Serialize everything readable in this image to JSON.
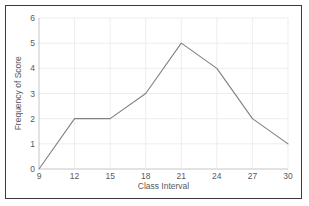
{
  "chart_data": {
    "type": "line",
    "title": "",
    "xlabel": "Class Interval",
    "ylabel": "Frequency of Score",
    "x": [
      9,
      12,
      15,
      18,
      21,
      24,
      27,
      30
    ],
    "values": [
      0,
      2,
      2,
      3,
      5,
      4,
      2,
      1
    ],
    "series": [
      {
        "name": "Frequency of Score",
        "values": [
          0,
          2,
          2,
          3,
          5,
          4,
          2,
          1
        ]
      }
    ],
    "xticks": [
      "9",
      "12",
      "15",
      "18",
      "21",
      "24",
      "27",
      "30"
    ],
    "yticks": [
      "0",
      "1",
      "2",
      "3",
      "4",
      "5",
      "6"
    ],
    "xlim": [
      9,
      30
    ],
    "ylim": [
      0,
      6
    ],
    "grid": true,
    "legend": false,
    "colors": {
      "line": "#808080",
      "grid": "#e8e8e8",
      "axis": "#bfbfbf",
      "text": "#595959",
      "border": "#3a3a3a",
      "background": "#ffffff"
    }
  }
}
